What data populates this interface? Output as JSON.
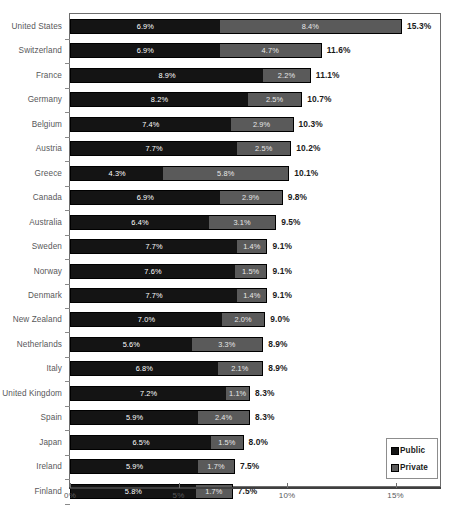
{
  "chart_data": {
    "type": "bar",
    "orientation": "horizontal",
    "stacked": true,
    "title": "",
    "subtitle": "",
    "xlabel": "",
    "ylabel": "",
    "xlim": [
      0,
      17.2
    ],
    "xticks": [
      0,
      5,
      10,
      15
    ],
    "xtick_labels": [
      "0%",
      "5%",
      "10%",
      "15%"
    ],
    "grid": false,
    "legend_position": "bottom-right",
    "legend": [
      {
        "name": "Public",
        "color": "#141414"
      },
      {
        "name": "Private",
        "color": "#5a5a5a"
      }
    ],
    "categories": [
      "United States",
      "Switzerland",
      "France",
      "Germany",
      "Belgium",
      "Austria",
      "Greece",
      "Canada",
      "Australia",
      "Sweden",
      "Norway",
      "Denmark",
      "New Zealand",
      "Netherlands",
      "Italy",
      "United Kingdom",
      "Spain",
      "Japan",
      "Ireland",
      "Finland"
    ],
    "series": [
      {
        "name": "Public",
        "values": [
          6.9,
          6.9,
          8.9,
          8.2,
          7.4,
          7.7,
          4.3,
          6.9,
          6.4,
          7.7,
          7.6,
          7.7,
          7.0,
          5.6,
          6.8,
          7.2,
          5.9,
          6.5,
          5.9,
          5.8
        ],
        "labels": [
          "6.9%",
          "6.9%",
          "8.9%",
          "8.2%",
          "7.4%",
          "7.7%",
          "4.3%",
          "6.9%",
          "6.4%",
          "7.7%",
          "7.6%",
          "7.7%",
          "7.0%",
          "5.6%",
          "6.8%",
          "7.2%",
          "5.9%",
          "6.5%",
          "5.9%",
          "5.8%"
        ]
      },
      {
        "name": "Private",
        "values": [
          8.4,
          4.7,
          2.2,
          2.5,
          2.9,
          2.5,
          5.8,
          2.9,
          3.1,
          1.4,
          1.5,
          1.4,
          2.0,
          3.3,
          2.1,
          1.1,
          2.4,
          1.5,
          1.7,
          1.7
        ],
        "labels": [
          "8.4%",
          "4.7%",
          "2.2%",
          "2.5%",
          "2.9%",
          "2.5%",
          "5.8%",
          "2.9%",
          "3.1%",
          "1.4%",
          "1.5%",
          "1.4%",
          "2.0%",
          "3.3%",
          "2.1%",
          "1.1%",
          "2.4%",
          "1.5%",
          "1.7%",
          "1.7%"
        ]
      }
    ],
    "totals": [
      15.3,
      11.6,
      11.1,
      10.7,
      10.3,
      10.2,
      10.1,
      9.8,
      9.5,
      9.1,
      9.1,
      9.1,
      9.0,
      8.9,
      8.9,
      8.3,
      8.3,
      8.0,
      7.5,
      7.5
    ],
    "total_labels": [
      "15.3%",
      "11.6%",
      "11.1%",
      "10.7%",
      "10.3%",
      "10.2%",
      "10.1%",
      "9.8%",
      "9.5%",
      "9.1%",
      "9.1%",
      "9.1%",
      "9.0%",
      "8.9%",
      "8.9%",
      "8.3%",
      "8.3%",
      "8.0%",
      "7.5%",
      "7.5%"
    ]
  }
}
